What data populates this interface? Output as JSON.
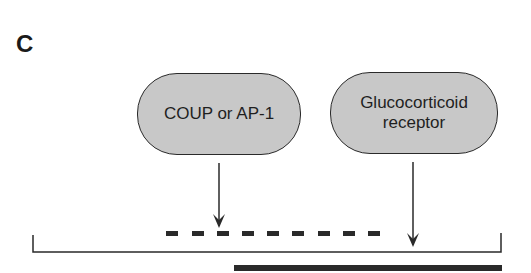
{
  "panel": {
    "label": "C"
  },
  "factors": [
    {
      "label": "COUP or AP-1"
    },
    {
      "label": "Glucocorticoid receptor",
      "line1": "Glucocorticoid",
      "line2": "receptor"
    }
  ],
  "colors": {
    "pill_fill": "#c8c8c8",
    "stroke": "#2a2a2a"
  }
}
